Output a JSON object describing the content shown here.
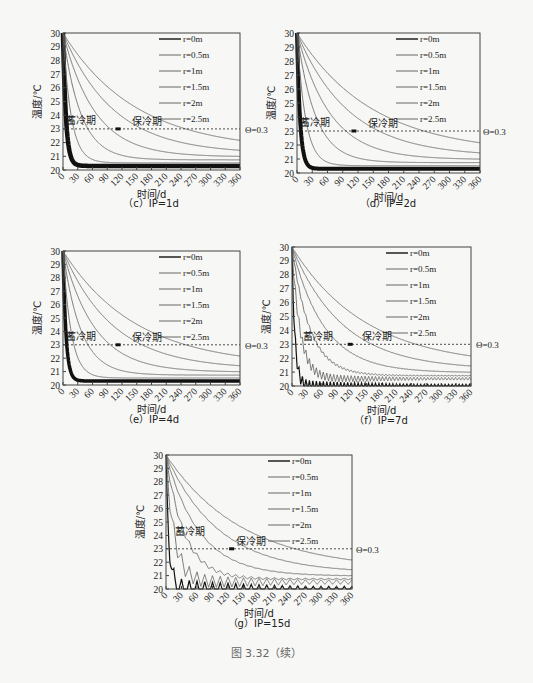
{
  "figure_caption": "图 3.32（续）",
  "common": {
    "xlabel": "时间/d",
    "ylabel": "温度/℃",
    "xticks": [
      "0",
      "30",
      "60",
      "90",
      "120",
      "150",
      "180",
      "210",
      "240",
      "270",
      "300",
      "330",
      "360"
    ],
    "yticks": [
      "20",
      "21",
      "22",
      "23",
      "24",
      "25",
      "26",
      "27",
      "28",
      "29",
      "30"
    ],
    "legend": [
      "r=0m",
      "r=0.5m",
      "r=1m",
      "r=1.5m",
      "r=2m",
      "r=2.5m"
    ],
    "annotation_storage": "蓄冷期",
    "annotation_retention": "保冷期",
    "threshold_label": "Θ=0.3",
    "threshold_value": 23
  },
  "chart_data": [
    {
      "id": "c",
      "type": "line",
      "title": "（c）IP=1d",
      "ip_days": 1,
      "xlabel": "时间/d",
      "ylabel": "温度/℃",
      "xlim": [
        0,
        360
      ],
      "ylim": [
        20,
        30
      ],
      "grid": false,
      "legend_position": "upper right",
      "series": [
        {
          "name": "r=0m",
          "x": [
            0,
            5,
            10,
            20,
            40,
            90,
            180,
            360
          ],
          "values": [
            30,
            23,
            22.3,
            21.6,
            21,
            20.6,
            20.4,
            20.3
          ]
        },
        {
          "name": "r=0.5m",
          "x": [
            0,
            10,
            20,
            40,
            90,
            180,
            360
          ],
          "values": [
            30,
            23.8,
            22.4,
            21.5,
            20.8,
            20.5,
            20.4
          ]
        },
        {
          "name": "r=1m",
          "x": [
            0,
            10,
            20,
            40,
            90,
            180,
            360
          ],
          "values": [
            30,
            25.8,
            24,
            22.5,
            21.2,
            20.7,
            20.5
          ]
        },
        {
          "name": "r=1.5m",
          "x": [
            0,
            10,
            20,
            40,
            90,
            180,
            360
          ],
          "values": [
            30,
            27.5,
            25.8,
            23.8,
            21.8,
            21,
            20.7
          ]
        },
        {
          "name": "r=2m",
          "x": [
            0,
            10,
            20,
            40,
            90,
            180,
            360
          ],
          "values": [
            30,
            28.6,
            27.2,
            25,
            22.6,
            21.4,
            21
          ]
        },
        {
          "name": "r=2.5m",
          "x": [
            0,
            10,
            20,
            40,
            90,
            180,
            360
          ],
          "values": [
            30,
            29.3,
            28.3,
            26.3,
            23.6,
            22,
            21.4
          ]
        }
      ],
      "annotations": [
        "蓄冷期",
        "保冷期",
        "Θ=0.3"
      ],
      "marker": {
        "x": 112,
        "y": 23
      }
    },
    {
      "id": "d",
      "type": "line",
      "title": "（d）IP=2d",
      "ip_days": 2,
      "xlim": [
        0,
        360
      ],
      "ylim": [
        20,
        30
      ],
      "marker": {
        "x": 112,
        "y": 23
      }
    },
    {
      "id": "e",
      "type": "line",
      "title": "（e）IP=4d",
      "ip_days": 4,
      "xlim": [
        0,
        360
      ],
      "ylim": [
        20,
        30
      ],
      "marker": {
        "x": 112,
        "y": 23
      }
    },
    {
      "id": "f",
      "type": "line",
      "title": "（f）IP=7d",
      "ip_days": 7,
      "xlim": [
        0,
        360
      ],
      "ylim": [
        20,
        30
      ],
      "marker": {
        "x": 117,
        "y": 23
      }
    },
    {
      "id": "g",
      "type": "line",
      "title": "（g）IP=15d",
      "ip_days": 15,
      "xlim": [
        0,
        360
      ],
      "ylim": [
        20,
        30
      ],
      "marker": {
        "x": 127,
        "y": 23
      }
    }
  ],
  "panels": {
    "c": {
      "caption": "（c）IP=1d"
    },
    "d": {
      "caption": "（d）IP=2d"
    },
    "e": {
      "caption": "（e）IP=4d"
    },
    "f": {
      "caption": "（f）IP=7d"
    },
    "g": {
      "caption": "（g）IP=15d"
    }
  }
}
